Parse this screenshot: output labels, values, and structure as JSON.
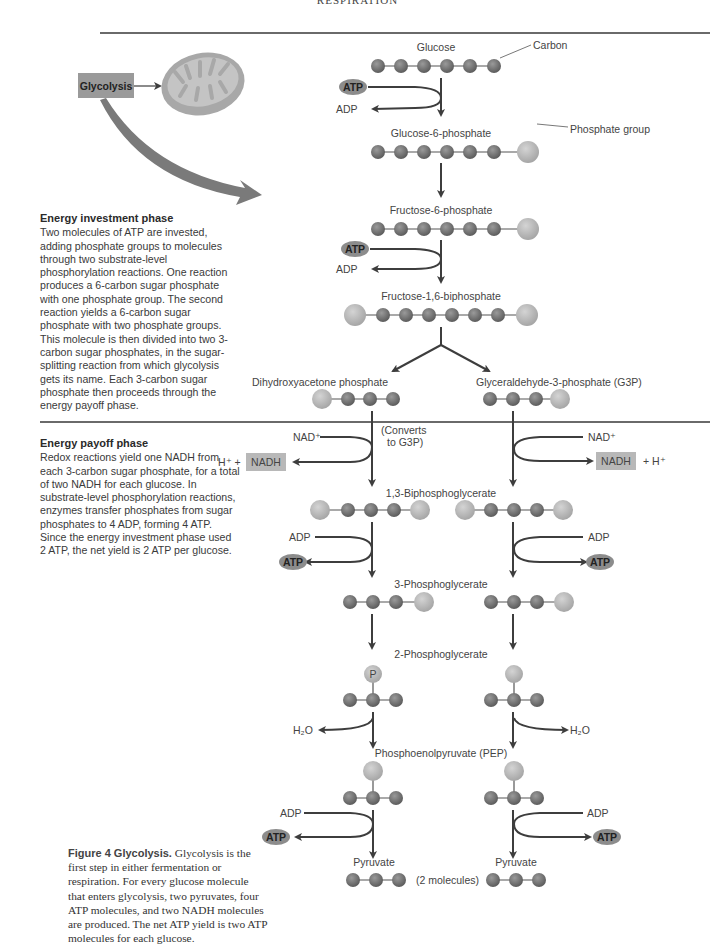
{
  "page": {
    "running_head": "RESPIRATION"
  },
  "colors": {
    "carbon": "#7d7d7d",
    "phosphate": "#bdbdbd",
    "atp_fill": "#8c8c8c",
    "nadh_fill": "#b8b8b8",
    "glycolysis_box": "#9a9a9a",
    "arrow": "#3d3d3d",
    "big_arrow": "#7a7a7a",
    "mitochondrion": "#a8a8a8",
    "rule": "#6a6a6a"
  },
  "overview": {
    "glycolysis_label": "Glycolysis",
    "mitochondrion_icon": "mitochondrion-icon"
  },
  "investment_phase": {
    "title": "Energy investment phase",
    "body": "Two molecules of ATP are invested, adding phosphate groups to molecules through two substrate-level phosphorylation reactions. One reaction produces a 6-carbon sugar phosphate with one phosphate group. The second reaction yields a 6-carbon sugar phosphate with two phosphate groups. This molecule is then divided into two 3-carbon sugar phosphates, in the sugar-splitting reaction from which glycolysis gets its name. Each 3-carbon sugar phosphate then proceeds through the energy payoff phase."
  },
  "payoff_phase": {
    "title": "Energy payoff phase",
    "body": "Redox reactions yield one NADH from each 3-carbon sugar phosphate, for a total of two NADH for each glucose. In substrate-level phosphorylation reactions, enzymes transfer phosphates from sugar phosphates to 4 ADP, forming 4 ATP. Since the energy investment phase used 2 ATP, the net yield is 2 ATP per glucose."
  },
  "caption": {
    "label": "Figure 4 Glycolysis.",
    "text": " Glycolysis is the first step in either fermentation or respiration. For every glucose molecule that enters glycolysis, two pyruvates, four ATP molecules, and two NADH molecules are produced. The net ATP yield is two ATP molecules for each glucose."
  },
  "diagram": {
    "callouts": {
      "carbon": "Carbon",
      "phosphate_group": "Phosphate group"
    },
    "molecules": {
      "glucose": "Glucose",
      "g6p": "Glucose-6-phosphate",
      "f6p": "Fructose-6-phosphate",
      "f16bp": "Fructose-1,6-biphosphate",
      "dhap": "Dihydroxyacetone phosphate",
      "g3p": "Glyceraldehyde-3-phosphate (G3P)",
      "bpg13": "1,3-Biphosphoglycerate",
      "pg3": "3-Phosphoglycerate",
      "pg2": "2-Phosphoglycerate",
      "pep": "Phosphoenolpyruvate (PEP)",
      "pyruvate_left": "Pyruvate",
      "pyruvate_right": "Pyruvate",
      "two_molecules": "(2 molecules)"
    },
    "converts_note_1": "(Converts",
    "converts_note_2": "to G3P)",
    "cofactors": {
      "atp": "ATP",
      "adp": "ADP",
      "nad_plus": "NAD⁺",
      "nadh": "NADH",
      "h_plus_left": "H⁺ +",
      "h_plus_right": "+ H⁺",
      "water": "H₂O",
      "p_label": "P"
    }
  }
}
